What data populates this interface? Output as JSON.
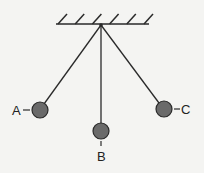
{
  "diagram": {
    "labels": {
      "a": "A",
      "b": "B",
      "c": "C"
    },
    "colors": {
      "line": "#2a2a2a",
      "bob_fill": "#6a6a6a",
      "bob_stroke": "#2a2a2a",
      "background": "#f4f4f2"
    },
    "hatch_count": 6
  }
}
